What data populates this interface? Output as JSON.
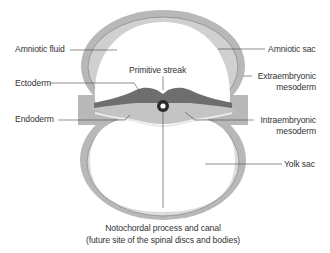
{
  "diagram": {
    "colors": {
      "background": "#ffffff",
      "outer_membrane": "#b8b8b8",
      "membrane_line": "#8a8a8a",
      "inner_membrane": "#d6d6d6",
      "ectoderm": "#6e6e6e",
      "intraembryonic_mesoderm": "#c4c4c4",
      "endoderm": "#e2e2e2",
      "cavity": "#ffffff",
      "leader_line": "#444444",
      "text": "#333333"
    },
    "labels": {
      "amniotic_fluid": "Amniotic fluid",
      "amniotic_sac": "Amniotic sac",
      "primitive_streak": "Primitive streak",
      "ectoderm": "Ectoderm",
      "extraembryonic_mesoderm_line1": "Extraembryonic",
      "extraembryonic_mesoderm_line2": "mesoderm",
      "endoderm": "Endoderm",
      "intraembryonic_mesoderm_line1": "Intraembryonic",
      "intraembryonic_mesoderm_line2": "mesoderm",
      "yolk_sac": "Yolk sac",
      "notochord_line1": "Notochordal process and canal",
      "notochord_line2": "(future site of the spinal discs and bodies)"
    }
  }
}
